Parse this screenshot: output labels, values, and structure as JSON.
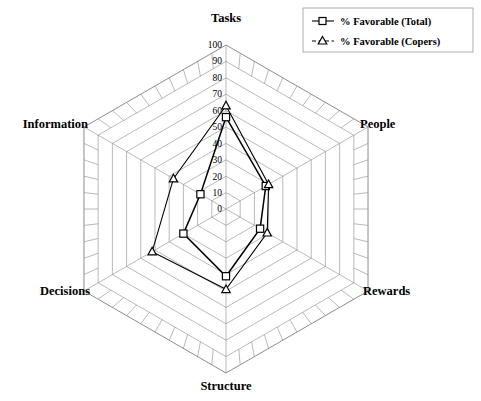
{
  "chart_data": {
    "type": "radar",
    "title": "",
    "categories": [
      "Tasks",
      "People",
      "Rewards",
      "Structure",
      "Decisions",
      "Information"
    ],
    "series": [
      {
        "name": "%  Favorable (Total)",
        "marker": "square",
        "values": [
          56,
          28,
          24,
          41,
          30,
          18
        ]
      },
      {
        "name": "%  Favorable (Copers)",
        "marker": "triangle",
        "values": [
          63,
          30,
          29,
          49,
          52,
          37
        ]
      }
    ],
    "radial_axis": {
      "min": 0,
      "max": 100,
      "step": 10,
      "tick_labels": [
        "0",
        "10",
        "20",
        "30",
        "40",
        "50",
        "60",
        "70",
        "80",
        "90",
        "100"
      ]
    },
    "grid": true,
    "legend_position": "top-right",
    "xlabel": "",
    "ylabel": ""
  },
  "axis_labels": {
    "tasks": "Tasks",
    "people": "People",
    "rewards": "Rewards",
    "structure": "Structure",
    "decisions": "Decisions",
    "information": "Information"
  },
  "ticks": {
    "t0": "0",
    "t10": "10",
    "t20": "20",
    "t30": "30",
    "t40": "40",
    "t50": "50",
    "t60": "60",
    "t70": "70",
    "t80": "80",
    "t90": "90",
    "t100": "100"
  },
  "legend": {
    "entry_total": "%  Favorable (Total)",
    "entry_copers": "%  Favorable (Copers)"
  },
  "colors": {
    "series_stroke": "#000000",
    "grid": "#8a8a8a",
    "background": "#ffffff"
  }
}
